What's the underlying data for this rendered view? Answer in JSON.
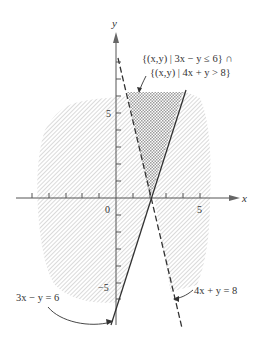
{
  "figure": {
    "type": "inequality-region-graph",
    "axes": {
      "x_label": "x",
      "y_label": "y",
      "origin_label": "0",
      "x_tick_label": "5",
      "y_tick_label_pos": "5",
      "y_tick_label_neg": "−5"
    },
    "lines": [
      {
        "equation": "3x − y = 6",
        "style": "solid",
        "label": "3x − y = 6"
      },
      {
        "equation": "4x + y = 8",
        "style": "dashed",
        "label": "4x + y = 8"
      }
    ],
    "region_label_line1": "{(x,y) | 3x − y ≤ 6} ∩",
    "region_label_line2": "{(x,y) | 4x + y > 8}",
    "colors": {
      "axis": "#555555",
      "hatch": "#b8b8b8",
      "crosshatch": "#9a9a9a",
      "line": "#333333"
    }
  }
}
